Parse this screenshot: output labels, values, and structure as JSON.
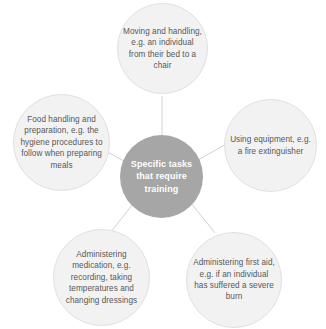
{
  "diagram": {
    "type": "hub-and-spoke",
    "center": {
      "label": "Specific tasks that require training",
      "fill_color": "#a6a6a6",
      "text_color": "#ffffff"
    },
    "node_fill_color": "#f2f2f2",
    "node_border_color": "#e0e0e0",
    "node_text_color": "#585858",
    "connector_color": "#d0d0d0",
    "background_color": "#ffffff",
    "nodes": [
      {
        "id": "top",
        "position": "top",
        "label": "Moving and handling, e.g. an individual from their bed to a chair"
      },
      {
        "id": "right",
        "position": "right",
        "label": "Using equipment, e.g. a fire extinguisher"
      },
      {
        "id": "bottom-right",
        "position": "bottom-right",
        "label": "Administering first aid, e.g. if an individual has suffered a severe burn"
      },
      {
        "id": "bottom-left",
        "position": "bottom-left",
        "label": "Administering medication, e.g. recording, taking temperatures and changing dressings"
      },
      {
        "id": "left",
        "position": "left",
        "label": "Food handling and preparation, e.g. the hygiene procedures to follow when preparing meals"
      }
    ]
  }
}
